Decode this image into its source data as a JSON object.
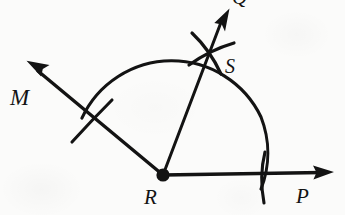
{
  "figure": {
    "background_color": "#fbfbfa",
    "ink_color": "#131313",
    "labels": {
      "vertex": "R",
      "ray_left": "M",
      "ray_right": "P",
      "ray_bisector": "Q",
      "arc_intersection": "S"
    },
    "points": {
      "R": {
        "x": 163,
        "y": 175
      },
      "S": {
        "x": 210,
        "y": 50
      },
      "M_arrow_tip": {
        "x": 27,
        "y": 61
      },
      "P_arrow_tip": {
        "x": 333,
        "y": 172
      },
      "Q_arrow_tip": {
        "x": 229,
        "y": 9
      }
    },
    "main_arc": {
      "center": {
        "x": 163,
        "y": 175
      },
      "radius": 99,
      "start_angle_deg": 145,
      "end_angle_deg": -8
    },
    "cross_arcs_at_S": {
      "center": {
        "x": 210,
        "y": 50
      },
      "count": 2
    },
    "tick_marks": {
      "on_ray_RM": {
        "x": 93,
        "y": 122
      },
      "on_ray_RP": {
        "x": 262,
        "y": 175
      }
    }
  }
}
